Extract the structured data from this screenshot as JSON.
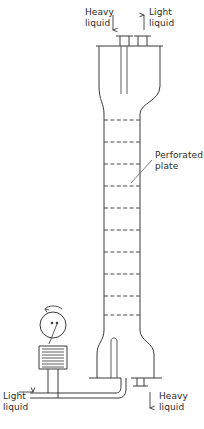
{
  "figure": {
    "type": "process-equipment-schematic",
    "width": 204,
    "height": 429,
    "background_color": "#ffffff",
    "line_color": "#3a3a3a"
  },
  "labels": {
    "heavy_liquid_inlet": "Heavy\nliquid",
    "light_liquid_outlet": "Light\nliquid",
    "perforated_plate": "Perforated\nplate",
    "light_liquid_inlet": "Light\nliquid",
    "heavy_liquid_outlet": "Heavy\nliquid"
  },
  "flow_arrows": {
    "heavy_in_direction": "down",
    "light_out_direction": "up",
    "light_in_direction": "right",
    "heavy_out_direction": "down",
    "pulse_rotation": "counter-clockwise"
  },
  "column": {
    "top_chamber": {
      "x_left": 99,
      "x_right": 160,
      "y_top": 46,
      "y_bottom": 92
    },
    "body": {
      "x_left": 104,
      "x_right": 140,
      "y_top": 114,
      "y_bottom": 318
    },
    "bottom_chamber": {
      "x_left": 97,
      "x_right": 154,
      "y_top": 330,
      "y_bottom": 378
    },
    "plate_count": 10,
    "plate_y_positions": [
      120,
      142,
      164,
      186,
      208,
      230,
      252,
      274,
      296,
      315
    ]
  },
  "pulse_unit": {
    "drive_wheel": {
      "cx": 53,
      "cy": 325,
      "r": 13
    },
    "bellows_convolutions": 7,
    "name": "pulse-generator"
  },
  "icons": {
    "rotation_arrow": "rotation-arrow-icon",
    "down_arrow": "arrow-down-icon",
    "up_arrow": "arrow-up-icon",
    "right_arrow": "arrow-right-icon"
  }
}
